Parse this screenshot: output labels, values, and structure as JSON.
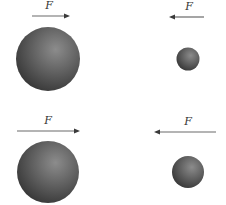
{
  "diagram": {
    "panels": [
      {
        "id": "top-left",
        "force": {
          "label": "F",
          "direction": "right",
          "x1": 32,
          "x2": 70,
          "y": 16,
          "label_x": 49,
          "label_y": 9
        },
        "ball": {
          "size": "large",
          "cx": 48,
          "cy": 59,
          "r": 32
        }
      },
      {
        "id": "top-right",
        "force": {
          "label": "F",
          "direction": "left",
          "x1": 169,
          "x2": 204,
          "y": 17,
          "label_x": 189,
          "label_y": 10
        },
        "ball": {
          "size": "small",
          "cx": 188,
          "cy": 59,
          "r": 11.5
        }
      },
      {
        "id": "bottom-left",
        "force": {
          "label": "F",
          "direction": "right",
          "x1": 17,
          "x2": 80,
          "y": 131,
          "label_x": 48,
          "label_y": 124
        },
        "ball": {
          "size": "large",
          "cx": 48,
          "cy": 172,
          "r": 31
        }
      },
      {
        "id": "bottom-right",
        "force": {
          "label": "F",
          "direction": "left",
          "x1": 154,
          "x2": 216,
          "y": 132,
          "label_x": 188,
          "label_y": 125
        },
        "ball": {
          "size": "medium",
          "cx": 188,
          "cy": 172,
          "r": 16
        }
      }
    ],
    "colors": {
      "ball_highlight": "#8c8c8c",
      "ball_mid": "#5e5e5e",
      "ball_shadow": "#383838",
      "arrow": "#6a6a6a",
      "label": "#333333",
      "background": "#ffffff"
    }
  }
}
